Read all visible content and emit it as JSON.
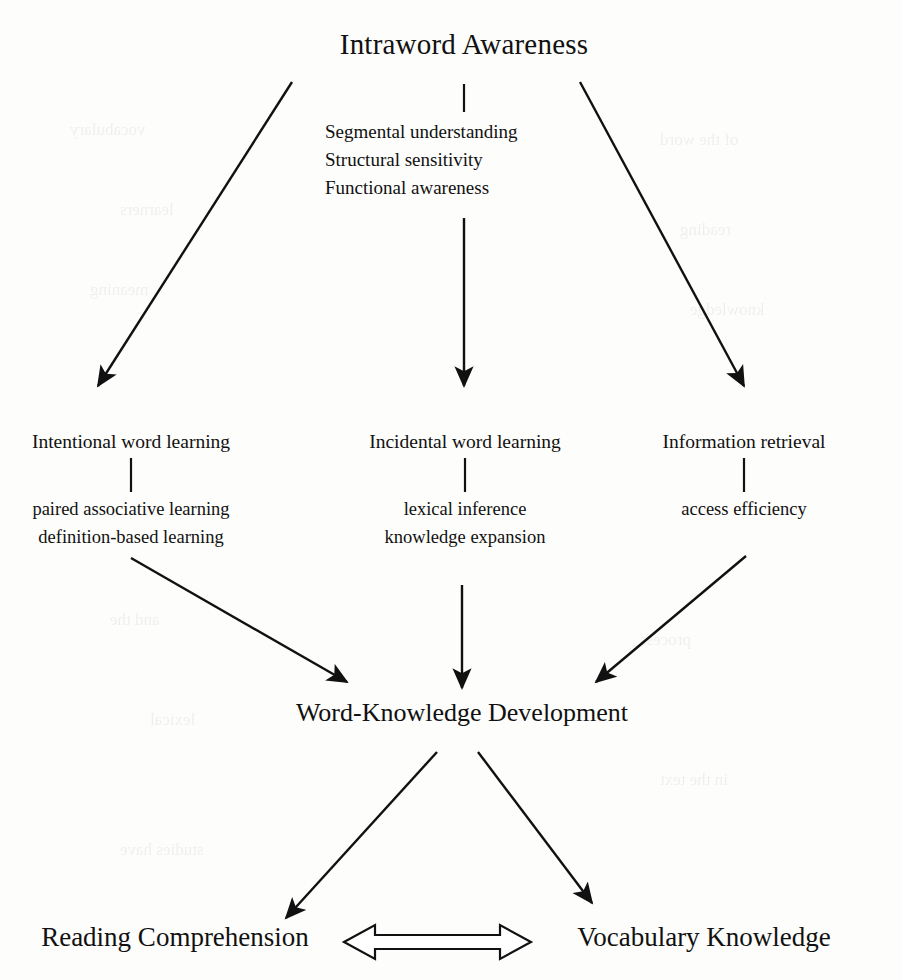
{
  "diagram": {
    "type": "flow-diagram",
    "title": "Intraword Awareness",
    "attributes": [
      "Segmental understanding",
      "Structural sensitivity",
      "Functional awareness"
    ],
    "branches": [
      {
        "head": "Intentional word  learning",
        "sub": [
          "paired associative learning",
          "definition-based learning"
        ]
      },
      {
        "head": "Incidental word learning",
        "sub": [
          "lexical inference",
          "knowledge expansion"
        ]
      },
      {
        "head": "Information retrieval",
        "sub": [
          "access efficiency"
        ]
      }
    ],
    "middle": "Word-Knowledge Development",
    "outcomes": [
      "Reading Comprehension",
      "Vocabulary Knowledge"
    ],
    "ink_color": "#111111",
    "background_color": "#fdfdfb",
    "bleed_through": [
      "vocabulary",
      "of the word",
      "learners",
      "reading",
      "meaning",
      "knowledge",
      "and the",
      "process",
      "lexical",
      "in the text",
      "studies have"
    ]
  }
}
